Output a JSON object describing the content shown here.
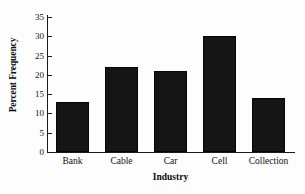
{
  "chart_data": {
    "type": "bar",
    "title": "",
    "categories": [
      "Bank",
      "Cable",
      "Car",
      "Cell",
      "Collection"
    ],
    "values": [
      13,
      22,
      21,
      30,
      14
    ],
    "xlabel": "Industry",
    "ylabel": "Percent Frequency",
    "ylim": [
      0,
      35
    ],
    "ytick_step": 5,
    "yticks": [
      0,
      5,
      10,
      15,
      20,
      25,
      30,
      35
    ],
    "ytick_labels": [
      "0",
      "5",
      "10",
      "15",
      "20",
      "25",
      "30",
      "35"
    ],
    "grid": false,
    "legend": null,
    "bar_color": "#151515",
    "axis_color": "#1a1a1a",
    "background_color": "#fdfdfd"
  }
}
